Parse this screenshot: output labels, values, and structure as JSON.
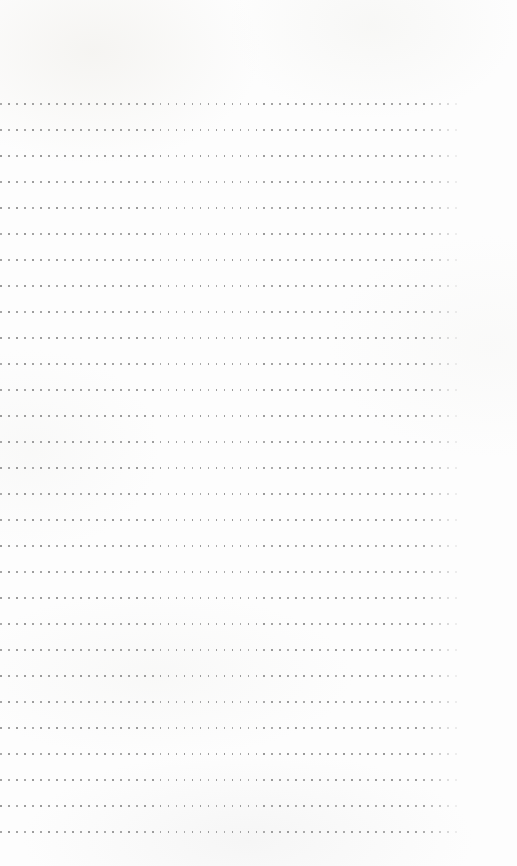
{
  "page": {
    "kind": "dotted-grid-notebook-page",
    "width": 517,
    "height": 866,
    "background_color": "#fdfdfd",
    "has_text_content": false,
    "has_handwriting": false,
    "visible_text": ""
  },
  "grid": {
    "dot_color": "#9a9a9a",
    "dot_size_px": 1.8,
    "row_count": 29,
    "dots_per_row": 58,
    "first_row_y": 103,
    "row_spacing_y": 26,
    "first_dot_x": 15,
    "dot_spacing_x": 8,
    "last_dot_x": 471,
    "right_edge_fade": true
  },
  "margins": {
    "top_px": 103,
    "bottom_px": 42,
    "left_px": 15,
    "right_px": 46
  }
}
